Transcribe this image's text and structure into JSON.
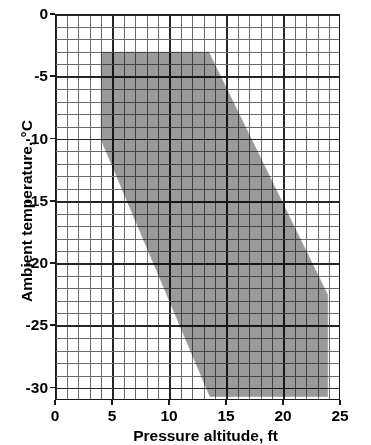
{
  "chart_data": {
    "type": "area",
    "title": "",
    "xlabel": "Pressure altitude, ft",
    "ylabel": "Ambient temperature, °C",
    "xlim": [
      0,
      25
    ],
    "ylim": [
      -31,
      0
    ],
    "x_ticks": [
      "0",
      "5",
      "10",
      "15",
      "20",
      "25"
    ],
    "x_tick_values": [
      0,
      5,
      10,
      15,
      20,
      25
    ],
    "y_ticks": [
      "0",
      "-5",
      "-10",
      "-15",
      "-20",
      "-25",
      "-30"
    ],
    "y_tick_values": [
      0,
      -5,
      -10,
      -15,
      -20,
      -25,
      -30
    ],
    "grid": "on",
    "grid_minor_x_step": 1,
    "grid_minor_y_step": 1,
    "grid_major_x_step": 5,
    "grid_major_y_step": 5,
    "legend": "none",
    "series": [
      {
        "name": "Icing envelope",
        "type": "polygon",
        "fill_color": "#9a9a9a",
        "edge_color": "#9a9a9a",
        "points": [
          [
            4.0,
            -3.0
          ],
          [
            13.5,
            -3.0
          ],
          [
            24.0,
            -22.6
          ],
          [
            24.0,
            -30.8
          ],
          [
            13.6,
            -30.8
          ],
          [
            4.0,
            -10.1
          ]
        ]
      }
    ],
    "annotations": []
  },
  "axes": {
    "x_title": "Pressure altitude, ft",
    "y_title": "Ambient temperature, °C"
  },
  "colors": {
    "shade": "#9a9a9a",
    "grid_minor": "#6d6d6d",
    "grid_major": "#262626",
    "frame": "#1a1a1a",
    "background": "#ffffff"
  }
}
